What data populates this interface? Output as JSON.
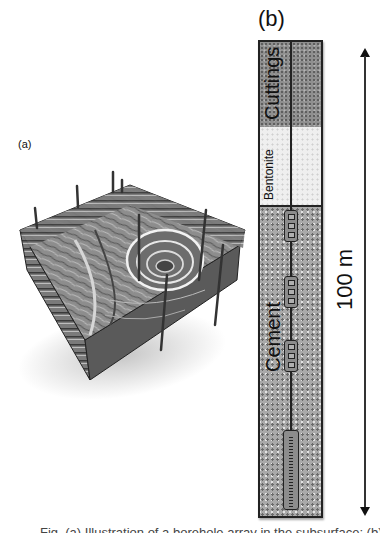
{
  "figure": {
    "panel_a": {
      "label": "(a)",
      "description": "3D geological block model with layered strata, a circular pit, and vertical boreholes"
    },
    "panel_b": {
      "label": "(b)",
      "layers": [
        {
          "name": "Cuttings",
          "color": "#8f8f8f"
        },
        {
          "name": "Bentonite",
          "color": "#efefef"
        },
        {
          "name": "Cement",
          "color": "#a9a9a9"
        }
      ],
      "sensor_modules": 3,
      "anchor_module": 1,
      "scale": {
        "label": "100 m"
      }
    },
    "caption_clipped": "Fig. (a) Illustration of a borehole array in the subsurface; (b) The"
  }
}
